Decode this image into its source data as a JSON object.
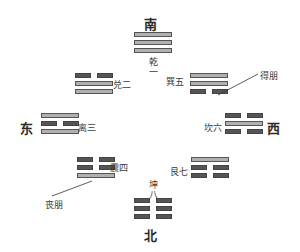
{
  "directions": {
    "south": "南",
    "north": "北",
    "east": "东",
    "west": "西"
  },
  "trigrams": [
    {
      "id": "qian",
      "label": "乾一",
      "lines": [
        "solid",
        "solid",
        "solid"
      ],
      "position": "top"
    },
    {
      "id": "dui",
      "label": "兑二",
      "lines": [
        "broken",
        "solid",
        "solid"
      ],
      "position": "upper-left"
    },
    {
      "id": "li",
      "label": "离三",
      "lines": [
        "solid",
        "broken",
        "solid"
      ],
      "position": "left"
    },
    {
      "id": "zhen",
      "label": "震四",
      "lines": [
        "broken",
        "broken",
        "solid"
      ],
      "position": "lower-left"
    },
    {
      "id": "xun",
      "label": "巽五",
      "lines": [
        "solid",
        "solid",
        "broken"
      ],
      "position": "upper-right"
    },
    {
      "id": "kan",
      "label": "坎六",
      "lines": [
        "broken",
        "solid",
        "broken"
      ],
      "position": "right"
    },
    {
      "id": "gen",
      "label": "艮七",
      "lines": [
        "solid",
        "broken",
        "broken"
      ],
      "position": "lower-right"
    },
    {
      "id": "kun",
      "label": "坤八",
      "lines": [
        "broken",
        "broken",
        "broken"
      ],
      "position": "bottom"
    }
  ],
  "annotations": {
    "gain_friend": "得朋",
    "lose_friend": "丧朋"
  },
  "vertical_labels": {
    "qian": [
      "乾",
      "一"
    ],
    "kun": [
      "坤",
      "八"
    ]
  }
}
